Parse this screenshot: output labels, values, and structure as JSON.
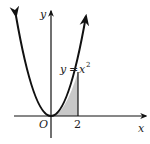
{
  "diagram": {
    "type": "function-graph",
    "function": "y = x^2",
    "labels": {
      "y_axis": "y",
      "x_axis": "x",
      "origin": "O",
      "x_tick": "2",
      "curve_lhs": "y",
      "curve_eq": "=",
      "curve_base": "x",
      "curve_exp": "2"
    },
    "shaded_region": {
      "description": "Area under y = x^2 from x = 0 to x = 2",
      "x_from": 0,
      "x_to": 2,
      "fill": "#c8c8c8"
    },
    "colors": {
      "stroke": "#111111",
      "background": "#ffffff"
    }
  }
}
